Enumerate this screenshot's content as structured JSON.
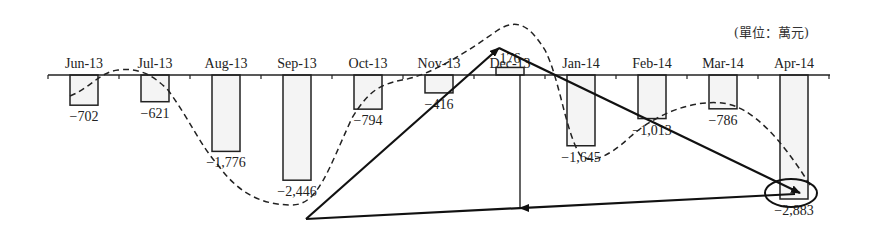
{
  "unit_label": "(單位：萬元)",
  "chart_data": {
    "type": "bar",
    "title": "",
    "unit": "單位：萬元",
    "xlabel": "",
    "ylabel": "",
    "categories": [
      "Jun-13",
      "Jul-13",
      "Aug-13",
      "Sep-13",
      "Oct-13",
      "Nov-13",
      "Dec-13",
      "Jan-14",
      "Feb-14",
      "Mar-14",
      "Apr-14"
    ],
    "values": [
      -702,
      -621,
      -1776,
      -2446,
      -794,
      -416,
      176,
      -1645,
      -1013,
      -786,
      -2883
    ],
    "value_labels": [
      "−702",
      "−621",
      "−1,776",
      "−2,446",
      "−794",
      "−416",
      "176",
      "−1,645",
      "−1,013",
      "−786",
      "−2,883"
    ],
    "ylim": [
      -3000,
      500
    ],
    "grid": false,
    "legend": null,
    "annotations": [
      {
        "type": "dashed-curve",
        "description": "smooth dashed trend line oscillating through the bars"
      },
      {
        "type": "arrow",
        "from": "Sep-13 (-2,446)",
        "to": "Dec-13 (176)"
      },
      {
        "type": "arrow",
        "from": "Dec-13 (176)",
        "to": "Apr-14 (-2,883)"
      },
      {
        "type": "line",
        "from": "Sep-13 (-2,446)",
        "to": "Apr-14 (-2,883)"
      },
      {
        "type": "arrow",
        "from": "Dec-13 axis",
        "to": "baseline Sep-13→Apr-14 line",
        "direction": "down"
      },
      {
        "type": "ellipse",
        "around": "Apr-14 (-2,883)"
      }
    ]
  }
}
